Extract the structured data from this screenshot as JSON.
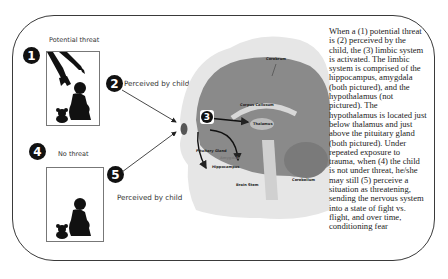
{
  "diagram": {
    "steps": [
      {
        "number": "1",
        "label": "Potential threat"
      },
      {
        "number": "2",
        "label": "Perceived by child"
      },
      {
        "number": "3",
        "label": ""
      },
      {
        "number": "4",
        "label": "No threat"
      },
      {
        "number": "5",
        "label": "Perceived by child"
      }
    ],
    "brain_labels": {
      "cerebrum": "Cerebrum",
      "corpus_callosum": "Corpus Callosum",
      "thalamus": "Thalamus",
      "pituitary": "Pituitary Gland",
      "amygdala": "Amygdala",
      "hippocampus": "Hippocampus",
      "brain_stem": "Brain Stem",
      "cerebellum": "Cerebellum"
    },
    "description": "When a (1) potential threat is (2) perceived by the child, the (3) limbic system is activated. The limbic system is comprised of the hippocampus, amygdala (both pictured), and the hypothalamus (not pictured). The hypothalamus is located just below thalamus and just above the pituitary gland (both pictured). Under repeated exposure to trauma, when (4) the child is not under threat, he/she may still (5) perceive a situation as threatening, sending the nervous system into a state of fight vs. flight, and over time, conditioning fear"
  },
  "colors": {
    "frame": "#3a3a3a",
    "badge": "#111111",
    "brain_dark": "#8a8a8a",
    "brain_light": "#c9c9c9",
    "head": "#e6e6e6"
  }
}
